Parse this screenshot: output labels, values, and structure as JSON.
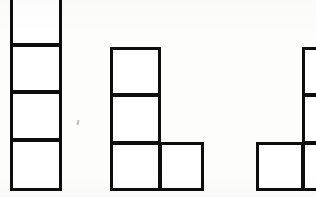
{
  "image": {
    "title": "Three polyomino block figures",
    "width": 316,
    "height": 197,
    "background_color": "#fdfdfc",
    "stroke_color": "#0d0d0d",
    "fill_color": "#ffffff",
    "stroke_width": 3
  },
  "figures": [
    {
      "name": "figure-1",
      "label": "I-tetromino, vertical column of four squares",
      "cell_count": 4,
      "clipped": "top",
      "cells": [
        {
          "name": "figure-1-cell-1",
          "x": 10,
          "y": -8,
          "w": 52,
          "h": 54
        },
        {
          "name": "figure-1-cell-2",
          "x": 10,
          "y": 44,
          "w": 52,
          "h": 49
        },
        {
          "name": "figure-1-cell-3",
          "x": 10,
          "y": 91,
          "w": 52,
          "h": 50
        },
        {
          "name": "figure-1-cell-4",
          "x": 10,
          "y": 139,
          "w": 52,
          "h": 52
        }
      ]
    },
    {
      "name": "figure-2",
      "label": "L-tetromino, column of three squares with one square right of the base",
      "cell_count": 4,
      "clipped": "none",
      "cells": [
        {
          "name": "figure-2-cell-1",
          "x": 110,
          "y": 47,
          "w": 51,
          "h": 49
        },
        {
          "name": "figure-2-cell-2",
          "x": 110,
          "y": 94,
          "w": 51,
          "h": 50
        },
        {
          "name": "figure-2-cell-3",
          "x": 110,
          "y": 142,
          "w": 51,
          "h": 49
        },
        {
          "name": "figure-2-cell-4",
          "x": 159,
          "y": 142,
          "w": 45,
          "h": 49
        }
      ]
    },
    {
      "name": "figure-3",
      "label": "J-tetromino, column of three squares with one square left of the base, cropped at right edge",
      "cell_count": 4,
      "clipped": "right",
      "cells": [
        {
          "name": "figure-3-cell-1",
          "x": 302,
          "y": 47,
          "w": 52,
          "h": 49
        },
        {
          "name": "figure-3-cell-2",
          "x": 302,
          "y": 94,
          "w": 52,
          "h": 50
        },
        {
          "name": "figure-3-cell-3",
          "x": 302,
          "y": 142,
          "w": 52,
          "h": 49
        },
        {
          "name": "figure-3-cell-4",
          "x": 256,
          "y": 142,
          "w": 48,
          "h": 49
        }
      ]
    }
  ],
  "marks": [
    {
      "name": "paper-speck",
      "x": 77,
      "y": 120
    }
  ]
}
